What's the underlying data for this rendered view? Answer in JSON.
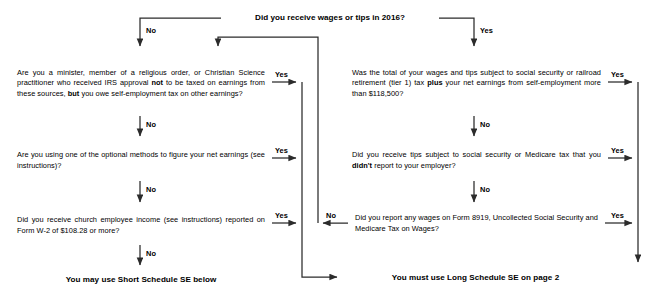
{
  "document": {
    "title": "Schedule SE (Form 1040) 2016 - Who Must File Flowchart",
    "tax_year": "2016"
  },
  "colors": {
    "line": "#2b2b2b",
    "text": "#000000",
    "background": "#ffffff"
  },
  "nodes": {
    "start": {
      "id": "start",
      "text": "Did you receive wages or tips in 2016?"
    },
    "minister": {
      "id": "minister",
      "text_parts": [
        {
          "t": "Are you a minister, member of a religious order, or Christian Science practitioner who received IRS approval ",
          "b": false
        },
        {
          "t": "not",
          "b": true
        },
        {
          "t": " to be taxed on earnings from these sources, ",
          "b": false
        },
        {
          "t": "but",
          "b": true
        },
        {
          "t": " you owe self-employment tax on other earnings?",
          "b": false
        }
      ],
      "text": "Are you a minister, member of a religious order, or Christian Science practitioner who received IRS approval not to be taxed on earnings from these sources, but you owe self-employment tax on other earnings?"
    },
    "optional_methods": {
      "id": "optional_methods",
      "text_parts": [
        {
          "t": "Are you using one of the optional methods to figure your net earnings (see instructions)?",
          "b": false
        }
      ],
      "text": "Are you using one of the optional methods to figure your net earnings (see instructions)?"
    },
    "church_income": {
      "id": "church_income",
      "text_parts": [
        {
          "t": "Did you receive church employee income (see instructions) reported on Form  W-2 of $108.28 or more?",
          "b": false
        }
      ],
      "text": "Did you receive church employee income (see instructions) reported on Form  W-2 of $108.28 or more?"
    },
    "wage_total": {
      "id": "wage_total",
      "text_parts": [
        {
          "t": "Was the total of your wages and tips subject to social security or railroad retirement (tier 1) tax ",
          "b": false
        },
        {
          "t": "plus",
          "b": true
        },
        {
          "t": " your net earnings from self-employment more than $118,500?",
          "b": false
        }
      ],
      "text": "Was the total of your wages and tips subject to social security or railroad retirement (tier 1) tax plus your net earnings from self-employment more than $118,500?"
    },
    "unreported_tips": {
      "id": "unreported_tips",
      "text_parts": [
        {
          "t": "Did you receive tips subject to social security or Medicare tax that you ",
          "b": false
        },
        {
          "t": "didn't",
          "b": true
        },
        {
          "t": " report to your employer?",
          "b": false
        }
      ],
      "text": "Did you receive tips subject to social security or Medicare tax that you didn't report to your employer?"
    },
    "form_8919": {
      "id": "form_8919",
      "text_parts": [
        {
          "t": "Did you report any wages on Form 8919, Uncollected Social Security and Medicare Tax on Wages?",
          "b": false
        }
      ],
      "text": "Did you report any wages on Form 8919, Uncollected Social Security and Medicare Tax on Wages?"
    },
    "short_se": {
      "id": "short_se",
      "text": "You may use Short Schedule SE below"
    },
    "long_se": {
      "id": "long_se",
      "text": "You must use Long Schedule SE on page 2"
    }
  },
  "edge_labels": {
    "start_no": "No",
    "start_yes": "Yes",
    "minister_yes": "Yes",
    "minister_no": "No",
    "optional_yes": "Yes",
    "optional_no": "No",
    "church_yes": "Yes",
    "church_no": "No",
    "wage_total_yes": "Yes",
    "wage_total_no": "No",
    "tips_yes": "Yes",
    "tips_no": "No",
    "form8919_yes": "Yes",
    "form8919_no": "No"
  }
}
